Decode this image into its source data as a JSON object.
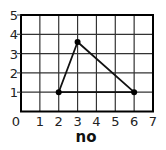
{
  "chart_data": {
    "type": "line",
    "title": "",
    "xlabel": "no",
    "ylabel": "",
    "xlim": [
      0,
      7
    ],
    "ylim": [
      0,
      5
    ],
    "x_ticks": [
      "0",
      "1",
      "2",
      "3",
      "4",
      "5",
      "6",
      "7"
    ],
    "y_ticks": [
      "1",
      "2",
      "3",
      "4",
      "5"
    ],
    "grid": true,
    "legend": null,
    "series": [
      {
        "name": "triangle",
        "closed": true,
        "markers": true,
        "points": [
          {
            "x": 2,
            "y": 1
          },
          {
            "x": 3,
            "y": 3.6
          },
          {
            "x": 6,
            "y": 1
          }
        ]
      }
    ]
  },
  "colors": {
    "frame": "#000000",
    "grid": "#333333",
    "line": "#111111",
    "marker": "#000000",
    "text": "#222222"
  }
}
